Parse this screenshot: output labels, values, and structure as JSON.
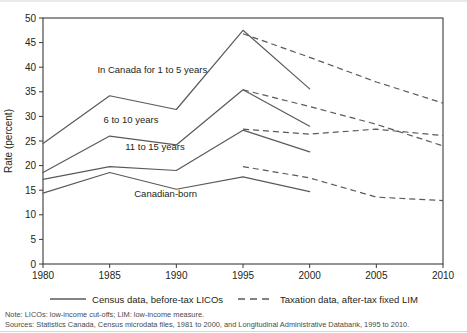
{
  "chart_data": {
    "type": "line",
    "title": "",
    "xlabel": "",
    "ylabel": "Rate (percent)",
    "xlim": [
      1980,
      2010
    ],
    "ylim": [
      0,
      50
    ],
    "xticks": [
      1980,
      1985,
      1990,
      1995,
      2000,
      2005,
      2010
    ],
    "yticks": [
      0,
      5,
      10,
      15,
      20,
      25,
      30,
      35,
      40,
      45,
      50
    ],
    "grid": false,
    "legend_position": "bottom",
    "series": [
      {
        "name": "In Canada for 1 to 5 years",
        "style": "solid",
        "source": "Census data, before-tax LICOs",
        "x": [
          1980,
          1985,
          1990,
          1995,
          2000
        ],
        "values": [
          24.5,
          34.2,
          31.4,
          47.5,
          35.6
        ]
      },
      {
        "name": "In Canada for 1 to 5 years",
        "style": "dashed",
        "source": "Taxation data, after-tax fixed LIM",
        "x": [
          1995,
          2000,
          2005,
          2010
        ],
        "values": [
          46.8,
          42.0,
          37.0,
          32.7
        ]
      },
      {
        "name": "6 to 10 years",
        "style": "solid",
        "source": "Census data, before-tax LICOs",
        "x": [
          1980,
          1985,
          1990,
          1995,
          2000
        ],
        "values": [
          18.6,
          26.0,
          24.2,
          35.4,
          28.0
        ]
      },
      {
        "name": "6 to 10 years",
        "style": "dashed",
        "source": "Taxation data, after-tax fixed LIM",
        "x": [
          1995,
          2000,
          2005,
          2010
        ],
        "values": [
          35.4,
          32.0,
          28.4,
          24.0
        ]
      },
      {
        "name": "11 to 15 years",
        "style": "solid",
        "source": "Census data, before-tax LICOs",
        "x": [
          1980,
          1985,
          1990,
          1995,
          2000
        ],
        "values": [
          17.2,
          19.8,
          19.0,
          27.2,
          22.8
        ]
      },
      {
        "name": "11 to 15 years",
        "style": "dashed",
        "source": "Taxation data, after-tax fixed LIM",
        "x": [
          1995,
          2000,
          2005,
          2010
        ],
        "values": [
          27.4,
          26.4,
          27.4,
          26.1
        ]
      },
      {
        "name": "Canadian-born",
        "style": "solid",
        "source": "Census data, before-tax LICOs",
        "x": [
          1980,
          1985,
          1990,
          1995,
          2000
        ],
        "values": [
          14.4,
          18.6,
          15.2,
          17.7,
          14.7
        ]
      },
      {
        "name": "Canadian-born",
        "style": "dashed",
        "source": "Taxation data, after-tax fixed LIM",
        "x": [
          1995,
          2000,
          2005,
          2010
        ],
        "values": [
          19.8,
          17.5,
          13.6,
          12.9
        ]
      }
    ],
    "annotations": [
      {
        "text": "In Canada for 1 to 5 years",
        "x": 1988.2,
        "y": 38.9
      },
      {
        "text": "6 to 10 years",
        "x": 1986.6,
        "y": 28.6
      },
      {
        "text": "11 to 15 years",
        "x": 1988.4,
        "y": 23.1
      },
      {
        "text": "Canadian-born",
        "x": 1989.2,
        "y": 13.7
      }
    ]
  },
  "axes": {
    "y_title": "Rate (percent)",
    "y_tick_labels": [
      "0",
      "5",
      "10",
      "15",
      "20",
      "25",
      "30",
      "35",
      "40",
      "45",
      "50"
    ],
    "x_tick_labels": [
      "1980",
      "1985",
      "1990",
      "1995",
      "2000",
      "2005",
      "2010"
    ]
  },
  "legend": {
    "items": [
      {
        "label": "Census data, before-tax LICOs",
        "style": "solid"
      },
      {
        "label": "Taxation data, after-tax fixed LIM",
        "style": "dashed"
      }
    ]
  },
  "footnotes": {
    "note": "Note: LICOs: low-income cut-offs; LIM: low-income measure.",
    "sources": "Sources: Statistics Canada, Census microdata files, 1981 to 2000, and Longitudinal Administrative Databank, 1995 to 2010."
  },
  "colors": {
    "line": "#5a5a5a",
    "axis": "#3b3b3b",
    "text": "#231f20",
    "footnote": "#4a4a4a"
  }
}
